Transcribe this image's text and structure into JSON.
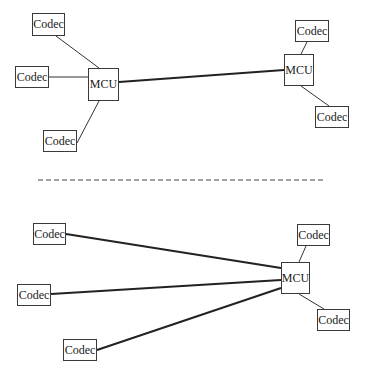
{
  "diagram": {
    "top_panel": {
      "left_cluster": {
        "mcu": {
          "label": "MCU",
          "x": 88,
          "y": 68,
          "w": 31,
          "h": 33
        },
        "codecs": [
          {
            "label": "Codec",
            "x": 32,
            "y": 13,
            "w": 33,
            "h": 23
          },
          {
            "label": "Codec",
            "x": 15,
            "y": 66,
            "w": 34,
            "h": 22
          },
          {
            "label": "Codec",
            "x": 43,
            "y": 130,
            "w": 34,
            "h": 22
          }
        ]
      },
      "right_cluster": {
        "mcu": {
          "label": "MCU",
          "x": 284,
          "y": 54,
          "w": 30,
          "h": 32
        },
        "codecs": [
          {
            "label": "Codec",
            "x": 295,
            "y": 20,
            "w": 34,
            "h": 22
          },
          {
            "label": "Codec",
            "x": 315,
            "y": 106,
            "w": 34,
            "h": 22
          }
        ]
      }
    },
    "separator": {
      "style": "dashed",
      "x1": 38,
      "x2": 325,
      "y": 180
    },
    "bottom_panel": {
      "mcu": {
        "label": "MCU",
        "x": 281,
        "y": 262,
        "w": 29,
        "h": 32
      },
      "remote_codecs": [
        {
          "label": "Codec",
          "x": 33,
          "y": 223,
          "w": 33,
          "h": 22
        },
        {
          "label": "Codec",
          "x": 17,
          "y": 284,
          "w": 34,
          "h": 22
        },
        {
          "label": "Codec",
          "x": 63,
          "y": 339,
          "w": 34,
          "h": 22
        }
      ],
      "local_codecs": [
        {
          "label": "Codec",
          "x": 297,
          "y": 224,
          "w": 33,
          "h": 22
        },
        {
          "label": "Codec",
          "x": 317,
          "y": 309,
          "w": 33,
          "h": 22
        }
      ]
    },
    "colors": {
      "line": "#2a2a2a",
      "box_border": "#3a3a3a",
      "text": "#1a1a1a",
      "background": "#ffffff"
    }
  }
}
